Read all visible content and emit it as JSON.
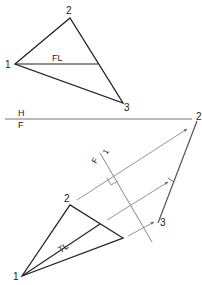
{
  "diagram": {
    "top_view": {
      "vertices": [
        {
          "label": "1",
          "x": 15,
          "y": 64
        },
        {
          "label": "2",
          "x": 70,
          "y": 18
        },
        {
          "label": "3",
          "x": 123,
          "y": 103
        }
      ],
      "line_label": "FL"
    },
    "fold_line": {
      "upper_label": "H",
      "lower_label": "F"
    },
    "front_view": {
      "vertices": [
        {
          "label": "1",
          "x": 22,
          "y": 276
        },
        {
          "label": "2",
          "x": 70,
          "y": 205
        },
        {
          "label": "3",
          "x": 123,
          "y": 238
        }
      ],
      "line_label": "TL"
    },
    "aux_fold_line": {
      "label_F": "F",
      "label_1": "1"
    },
    "edge_view": {
      "label_2": "2",
      "label_3": "3"
    }
  }
}
